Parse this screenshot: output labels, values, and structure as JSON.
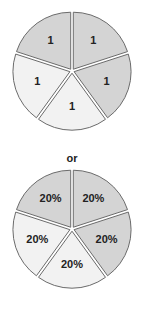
{
  "chart_data": [
    {
      "type": "pie",
      "title": "",
      "categories": [
        "Slice A",
        "Slice B",
        "Slice C",
        "Slice D",
        "Slice E"
      ],
      "values": [
        1,
        1,
        1,
        1,
        1
      ],
      "labels": [
        "1",
        "1",
        "1",
        "1",
        "1"
      ],
      "colors": [
        "#d4d4d4",
        "#d4d4d4",
        "#f2f2f2",
        "#f2f2f2",
        "#d4d4d4"
      ],
      "exploded": true
    },
    {
      "type": "pie",
      "title": "",
      "categories": [
        "Slice A",
        "Slice B",
        "Slice C",
        "Slice D",
        "Slice E"
      ],
      "values": [
        20,
        20,
        20,
        20,
        20
      ],
      "labels": [
        "20%",
        "20%",
        "20%",
        "20%",
        "20%"
      ],
      "colors": [
        "#d4d4d4",
        "#d4d4d4",
        "#f2f2f2",
        "#f2f2f2",
        "#d4d4d4"
      ],
      "exploded": true
    }
  ],
  "separator_text": "or",
  "colors": {
    "dark_slice": "#d4d4d4",
    "light_slice": "#f2f2f2",
    "stroke": "#6b6b6b",
    "text": "#222222"
  }
}
